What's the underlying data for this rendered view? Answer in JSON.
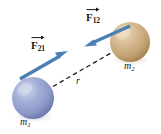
{
  "figure": {
    "background_color": "#ffffff"
  },
  "bodies": [
    {
      "id": "m1",
      "label": "m",
      "subscript": "1",
      "color": "#8e9ccb",
      "highlight_color": "#c9d0e6",
      "shadow_color": "#5d6a9c",
      "center_x": 33,
      "center_y": 98,
      "radius": 21
    },
    {
      "id": "m2",
      "label": "m",
      "subscript": "2",
      "color": "#cbab7e",
      "highlight_color": "#e6d3b2",
      "shadow_color": "#9c7c4f",
      "center_x": 130,
      "center_y": 42,
      "radius": 20
    }
  ],
  "vectors": [
    {
      "id": "F21",
      "label": "F",
      "subscript": "21",
      "color": "#4a7fb5",
      "direction": "up-right",
      "tail_x": 20,
      "tail_y": 79,
      "head_x": 67,
      "head_y": 52
    },
    {
      "id": "F12",
      "label": "F",
      "subscript": "12",
      "color": "#4a7fb5",
      "direction": "down-left",
      "tail_x": 130,
      "tail_y": 26,
      "head_x": 85,
      "head_y": 46
    }
  ],
  "distance": {
    "id": "r",
    "label": "r",
    "style": "dashed",
    "color": "#1a1a1a",
    "from_x": 33,
    "from_y": 98,
    "to_x": 130,
    "to_y": 42
  }
}
